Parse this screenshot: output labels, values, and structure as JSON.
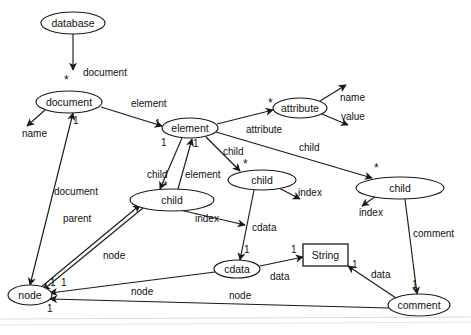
{
  "diagram": {
    "type": "entity-relationship",
    "background_color": "#ffffff",
    "stroke_color": "#1a1a1a",
    "nodes": [
      {
        "id": "database",
        "label": "database",
        "shape": "ellipse",
        "cx": 73,
        "cy": 23,
        "rx": 32,
        "ry": 11
      },
      {
        "id": "document",
        "label": "document",
        "shape": "ellipse",
        "cx": 69,
        "cy": 102,
        "rx": 33,
        "ry": 11
      },
      {
        "id": "element",
        "label": "element",
        "shape": "ellipse",
        "cx": 190,
        "cy": 128,
        "rx": 28,
        "ry": 10
      },
      {
        "id": "attribute",
        "label": "attribute",
        "shape": "ellipse",
        "cx": 300,
        "cy": 108,
        "rx": 27,
        "ry": 10
      },
      {
        "id": "child_l",
        "label": "child",
        "shape": "ellipse",
        "cx": 172,
        "cy": 200,
        "rx": 42,
        "ry": 11
      },
      {
        "id": "child_m",
        "label": "child",
        "shape": "ellipse",
        "cx": 262,
        "cy": 180,
        "rx": 34,
        "ry": 10
      },
      {
        "id": "child_r",
        "label": "child",
        "shape": "ellipse",
        "cx": 400,
        "cy": 188,
        "rx": 44,
        "ry": 11
      },
      {
        "id": "cdata",
        "label": "cdata",
        "shape": "ellipse",
        "cx": 237,
        "cy": 269,
        "rx": 23,
        "ry": 9
      },
      {
        "id": "string",
        "label": "String",
        "shape": "rect",
        "x": 303,
        "y": 244,
        "w": 45,
        "h": 22
      },
      {
        "id": "node",
        "label": "node",
        "shape": "ellipse",
        "cx": 30,
        "cy": 295,
        "rx": 22,
        "ry": 10
      },
      {
        "id": "comment",
        "label": "comment",
        "shape": "ellipse",
        "cx": 419,
        "cy": 305,
        "rx": 31,
        "ry": 11
      }
    ],
    "edges": [
      {
        "from": "database",
        "to": "document",
        "label": "document",
        "source_mult": "",
        "target_mult": "*"
      },
      {
        "from": "document",
        "to": "name",
        "label": "name",
        "source_mult": "",
        "target_mult": ""
      },
      {
        "from": "document",
        "to": "element",
        "label": "element",
        "source_mult": "",
        "target_mult": "1"
      },
      {
        "from": "document",
        "to": "node",
        "label": "document",
        "source_mult": "1",
        "target_mult": ""
      },
      {
        "from": "element",
        "to": "attribute",
        "label": "attribute",
        "source_mult": "",
        "target_mult": "*"
      },
      {
        "from": "attribute",
        "to": "name",
        "label": "name",
        "source_mult": "",
        "target_mult": ""
      },
      {
        "from": "attribute",
        "to": "value",
        "label": "value",
        "source_mult": "",
        "target_mult": ""
      },
      {
        "from": "element",
        "to": "child_l",
        "label": "child",
        "source_mult": "1",
        "target_mult": "*"
      },
      {
        "from": "child_l",
        "to": "element",
        "label": "element",
        "source_mult": "",
        "target_mult": "1"
      },
      {
        "from": "element",
        "to": "child_m",
        "label": "child",
        "source_mult": "",
        "target_mult": "*"
      },
      {
        "from": "element",
        "to": "child_r",
        "label": "child",
        "source_mult": "",
        "target_mult": "*"
      },
      {
        "from": "child_l",
        "to": "index",
        "label": "index",
        "source_mult": "",
        "target_mult": ""
      },
      {
        "from": "child_m",
        "to": "index",
        "label": "index",
        "source_mult": "",
        "target_mult": ""
      },
      {
        "from": "child_r",
        "to": "index",
        "label": "index",
        "source_mult": "",
        "target_mult": ""
      },
      {
        "from": "child_m",
        "to": "cdata",
        "label": "cdata",
        "source_mult": "",
        "target_mult": "1"
      },
      {
        "from": "child_r",
        "to": "comment",
        "label": "comment",
        "source_mult": "",
        "target_mult": "1"
      },
      {
        "from": "cdata",
        "to": "string",
        "label": "data",
        "source_mult": "",
        "target_mult": "1"
      },
      {
        "from": "comment",
        "to": "string",
        "label": "data",
        "source_mult": "1",
        "target_mult": ""
      },
      {
        "from": "node",
        "to": "child_l",
        "label": "parent",
        "source_mult": "1",
        "target_mult": ""
      },
      {
        "from": "child_l",
        "to": "node",
        "label": "node",
        "source_mult": "",
        "target_mult": ""
      },
      {
        "from": "cdata",
        "to": "node",
        "label": "node",
        "source_mult": "",
        "target_mult": "1"
      },
      {
        "from": "comment",
        "to": "node",
        "label": "node",
        "source_mult": "",
        "target_mult": "1"
      }
    ],
    "labels": {
      "database": "database",
      "document": "document",
      "element": "element",
      "attribute": "attribute",
      "child": "child",
      "cdata": "cdata",
      "string": "String",
      "node": "node",
      "comment": "comment",
      "name": "name",
      "value": "value",
      "index": "index",
      "data": "data",
      "parent": "parent",
      "one": "1",
      "star": "*"
    }
  }
}
